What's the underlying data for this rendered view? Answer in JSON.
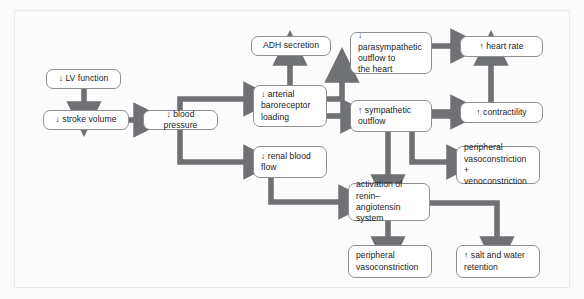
{
  "diagram": {
    "type": "flowchart",
    "frame_color": "#e9eaec",
    "box_border_color": "#8d8f93",
    "arrow_color": "#6f7174",
    "background": "#fcfcfd",
    "nodes": [
      {
        "id": "lv_function",
        "label": "↓ LV function",
        "x": 46,
        "y": 69,
        "w": 75,
        "h": 20,
        "align": "center"
      },
      {
        "id": "stroke_volume",
        "label": "↓ stroke volume",
        "x": 43,
        "y": 110,
        "w": 86,
        "h": 20,
        "align": "center"
      },
      {
        "id": "blood_pressure",
        "label": "↓ blood pressure",
        "x": 143,
        "y": 110,
        "w": 75,
        "h": 20,
        "align": "center"
      },
      {
        "id": "adh_secretion",
        "label": "ADH secretion",
        "x": 251,
        "y": 36,
        "w": 80,
        "h": 20,
        "align": "center"
      },
      {
        "id": "baroreceptor",
        "label": "↓ arterial\nbaroreceptor\nloading",
        "x": 253,
        "y": 85,
        "w": 74,
        "h": 42,
        "align": "left"
      },
      {
        "id": "renal_blood_flow",
        "label": "↓ renal blood\nflow",
        "x": 253,
        "y": 146,
        "w": 74,
        "h": 32,
        "align": "left"
      },
      {
        "id": "parasympathetic",
        "label": "↓ parasympathetic\noutflow to\nthe heart",
        "x": 350,
        "y": 32,
        "w": 82,
        "h": 42,
        "align": "left"
      },
      {
        "id": "sympathetic",
        "label": "↑ sympathetic\noutflow",
        "x": 350,
        "y": 100,
        "w": 82,
        "h": 32,
        "align": "left"
      },
      {
        "id": "renin_angiotensin",
        "label": "activation of\nrenin–angiotensin\nsystem",
        "x": 348,
        "y": 183,
        "w": 82,
        "h": 38,
        "align": "left"
      },
      {
        "id": "heart_rate",
        "label": "↑ heart rate",
        "x": 460,
        "y": 36,
        "w": 83,
        "h": 21,
        "align": "center"
      },
      {
        "id": "contractility",
        "label": "↑ contractility",
        "x": 460,
        "y": 102,
        "w": 83,
        "h": 21,
        "align": "center"
      },
      {
        "id": "vaso_veno",
        "label": "peripheral\nvasoconstriction +\nvenoconstriction",
        "x": 456,
        "y": 146,
        "w": 84,
        "h": 38,
        "align": "left"
      },
      {
        "id": "periph_vaso",
        "label": "peripheral\nvasoconstriction",
        "x": 348,
        "y": 245,
        "w": 84,
        "h": 33,
        "align": "left"
      },
      {
        "id": "salt_water",
        "label": "↑ salt and water\nretention",
        "x": 456,
        "y": 245,
        "w": 84,
        "h": 33,
        "align": "left"
      }
    ],
    "edges": [
      {
        "from": "lv_function",
        "to": "stroke_volume",
        "kind": "down"
      },
      {
        "from": "stroke_volume",
        "to": "blood_pressure",
        "kind": "right"
      },
      {
        "from": "blood_pressure",
        "to": "baroreceptor",
        "kind": "up-then-right"
      },
      {
        "from": "blood_pressure",
        "to": "renal_blood_flow",
        "kind": "down-then-right"
      },
      {
        "from": "baroreceptor",
        "to": "adh_secretion",
        "kind": "up"
      },
      {
        "from": "baroreceptor",
        "to": "parasympathetic",
        "kind": "right-then-up"
      },
      {
        "from": "baroreceptor",
        "to": "sympathetic",
        "kind": "right"
      },
      {
        "from": "parasympathetic",
        "to": "heart_rate",
        "kind": "right"
      },
      {
        "from": "sympathetic",
        "to": "heart_rate",
        "kind": "right-then-up"
      },
      {
        "from": "sympathetic",
        "to": "contractility",
        "kind": "right"
      },
      {
        "from": "sympathetic",
        "to": "vaso_veno",
        "kind": "down-then-right"
      },
      {
        "from": "sympathetic",
        "to": "renin_angiotensin",
        "kind": "down"
      },
      {
        "from": "renal_blood_flow",
        "to": "renin_angiotensin",
        "kind": "down-then-right"
      },
      {
        "from": "renin_angiotensin",
        "to": "periph_vaso",
        "kind": "down"
      },
      {
        "from": "renin_angiotensin",
        "to": "salt_water",
        "kind": "right-then-down"
      }
    ]
  }
}
